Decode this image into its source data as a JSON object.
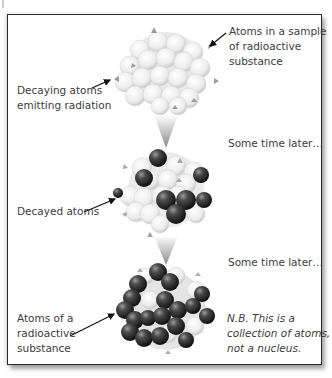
{
  "diagram": {
    "stages": [
      {
        "id": "initial",
        "description": "All atoms undecayed (light grey)",
        "labels": {
          "sample": [
            "Atoms in a sample",
            "of radioactive",
            "substance"
          ],
          "decaying": [
            "Decaying atoms",
            "emitting radiation"
          ]
        }
      },
      {
        "id": "later-1",
        "time_label": "Some time later…",
        "labels": {
          "decayed": "Decayed atoms"
        }
      },
      {
        "id": "later-2",
        "time_label": "Some time later…",
        "labels": {
          "atoms_of": [
            "Atoms of a",
            "radioactive",
            "substance"
          ]
        },
        "note": [
          "N.B. This is a",
          "collection of atoms,",
          "not a nucleus."
        ]
      }
    ],
    "colors": {
      "undecayed": "#e6e6e6",
      "decayed": "#2e2e2e",
      "arrow": "#9a9a9a",
      "frame": "#2a2a2a"
    }
  }
}
